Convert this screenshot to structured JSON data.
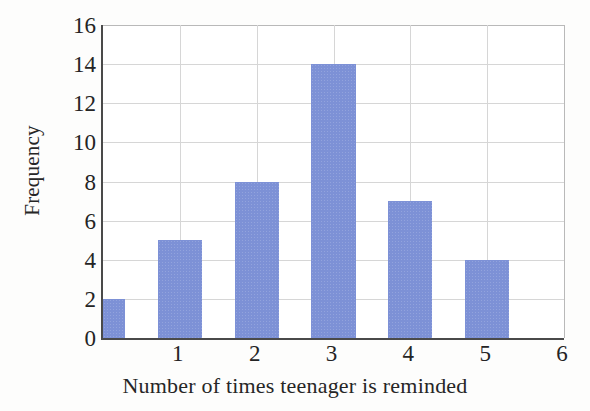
{
  "chart_data": {
    "type": "bar",
    "title": "",
    "xlabel": "Number of times teenager is reminded",
    "ylabel": "Frequency",
    "categories": [
      "0",
      "1",
      "2",
      "3",
      "4",
      "5"
    ],
    "values": [
      2,
      5,
      8,
      14,
      7,
      4
    ],
    "xlim": [
      0,
      6
    ],
    "ylim": [
      0,
      16
    ],
    "x_tick_labels": [
      "1",
      "2",
      "3",
      "4",
      "5",
      "6"
    ],
    "x_tick_values": [
      1,
      2,
      3,
      4,
      5,
      6
    ],
    "y_tick_labels": [
      "0",
      "2",
      "4",
      "6",
      "8",
      "10",
      "12",
      "14",
      "16"
    ],
    "y_tick_values": [
      0,
      2,
      4,
      6,
      8,
      10,
      12,
      14,
      16
    ],
    "grid": true,
    "legend": false,
    "legend_position": "none",
    "bar_color": "#7d91d6",
    "grid_color": "#d6d6d6",
    "axis_color": "#4a4a4a",
    "background_color": "#ffffff"
  }
}
